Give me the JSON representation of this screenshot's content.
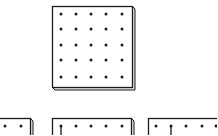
{
  "figure": {
    "colors": {
      "background": "#ffffff",
      "ink": "#1a1a1a",
      "board_face": "#ffffff",
      "board_side": "#e6e6e6"
    }
  },
  "boards": [
    {
      "id": "top-board",
      "x": 52,
      "y": 6,
      "w": 80,
      "h": 81,
      "depth": 3,
      "peg_cols": [
        61,
        76,
        91,
        106,
        122
      ],
      "peg_rows": [
        14,
        29,
        45,
        60,
        77
      ],
      "bands": []
    },
    {
      "id": "bottom-left-board",
      "x": -52,
      "y": 118,
      "w": 82,
      "h": 40,
      "depth": 3,
      "peg_cols": [
        -40,
        -25,
        -10,
        5,
        21
      ],
      "peg_rows": [
        126
      ],
      "bands": []
    },
    {
      "id": "bottom-middle-board",
      "x": 52,
      "y": 118,
      "w": 79,
      "h": 40,
      "depth": 3,
      "peg_cols": [
        61,
        76,
        91,
        106,
        122
      ],
      "peg_rows": [
        126
      ],
      "bands": [
        {
          "x1": 61,
          "y1": 126,
          "x2": 61,
          "y2": 140
        }
      ]
    },
    {
      "id": "bottom-right-board",
      "x": 148,
      "y": 118,
      "w": 80,
      "h": 40,
      "depth": 3,
      "peg_cols": [
        156,
        171,
        186,
        202,
        216
      ],
      "peg_rows": [
        126
      ],
      "bands": [
        {
          "x1": 171,
          "y1": 126,
          "x2": 171,
          "y2": 140
        }
      ]
    }
  ]
}
